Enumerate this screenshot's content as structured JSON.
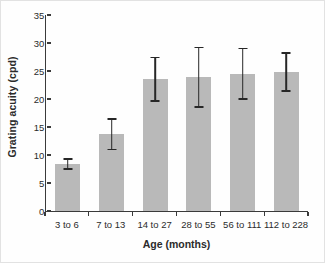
{
  "chart_data": {
    "type": "bar",
    "title": "",
    "xlabel": "Age (months)",
    "ylabel": "Grating acuity (cpd)",
    "categories": [
      "3 to 6",
      "7 to 13",
      "14 to 27",
      "28 to 55",
      "56 to 111",
      "112 to 228"
    ],
    "values": [
      8.4,
      13.7,
      23.5,
      23.9,
      24.5,
      24.8
    ],
    "errors": [
      0.9,
      2.7,
      3.9,
      5.3,
      4.5,
      3.4
    ],
    "error_upper": [
      9.3,
      16.4,
      27.4,
      29.2,
      29.0,
      28.2
    ],
    "error_lower": [
      7.5,
      11.0,
      19.6,
      18.6,
      20.0,
      21.4
    ],
    "ylim": [
      0,
      35
    ],
    "yticks": [
      0,
      5,
      10,
      15,
      20,
      25,
      30,
      35
    ],
    "ytick_labels": [
      "0",
      "5",
      "10",
      "15",
      "20",
      "25",
      "30",
      "35"
    ],
    "grid": false,
    "legend": false,
    "legend_position": "none",
    "bar_color": "#b9b9b9",
    "error_color": "#272727",
    "axis_color": "#3a3a3a",
    "background": "#fefefe",
    "border_color": "#e2e2e2"
  }
}
